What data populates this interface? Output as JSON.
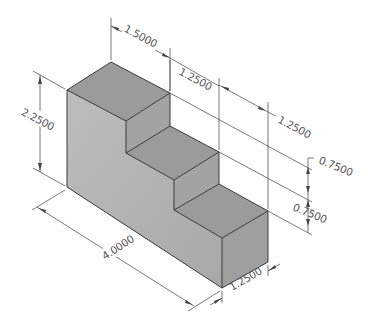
{
  "diagram": {
    "colors": {
      "background": "#ffffff",
      "top_face": "#9a9a9a",
      "front_face": "#b4b4b4",
      "riser_face": "#a2a2a2",
      "right_face": "#9e9e9e",
      "edge": "#3a3a3a",
      "dimension": "#555555"
    },
    "dimensions": {
      "top_step_depth": "1.5000",
      "middle_step_depth": "1.2500",
      "bottom_step_depth": "1.2500",
      "overall_height": "2.2500",
      "overall_length": "4.0000",
      "width": "1.2500",
      "upper_riser_height": "0.7500",
      "lower_riser_height": "0.7500"
    }
  }
}
